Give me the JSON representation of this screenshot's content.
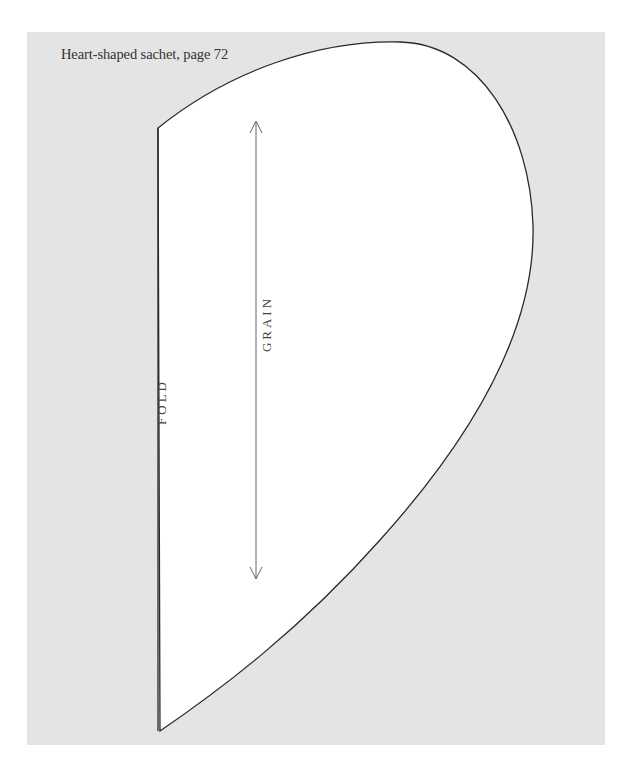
{
  "caption": "Heart-shaped sachet, page 72",
  "pattern": {
    "fold_label": "FOLD",
    "grain_label": "GRAIN",
    "panel_color": "#e4e4e4",
    "piece_color": "#ffffff",
    "outline_color": "#2a2a2a"
  }
}
